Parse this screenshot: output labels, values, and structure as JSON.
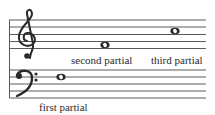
{
  "figure": {
    "colors": {
      "ink": "#2a2a2a",
      "staff_line": "#5a5a5a",
      "background": "#ffffff"
    },
    "treble_staff": {
      "clef": "treble-clef"
    },
    "bass_staff": {
      "clef": "bass-clef"
    },
    "notes": [
      {
        "id": "first",
        "label": "first partial",
        "staff": "bass",
        "position": "second line from top",
        "type": "whole note"
      },
      {
        "id": "second",
        "label": "second partial",
        "staff": "treble",
        "position": "bottom space",
        "type": "whole note"
      },
      {
        "id": "third",
        "label": "third partial",
        "staff": "treble",
        "position": "second space from top",
        "type": "whole note"
      }
    ]
  }
}
